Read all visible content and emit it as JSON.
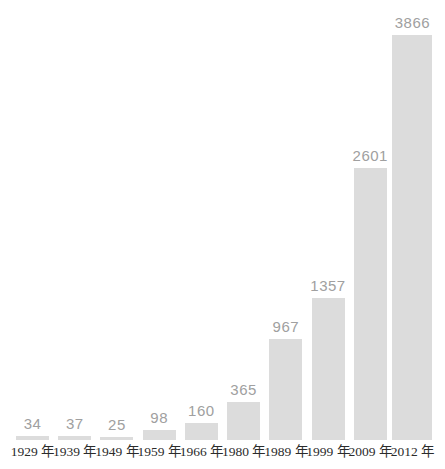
{
  "chart_data": {
    "type": "bar",
    "title": "",
    "xlabel": "",
    "ylabel": "",
    "categories": [
      "1929 年",
      "1939 年",
      "1949 年",
      "1959 年",
      "1966 年",
      "1980 年",
      "1989 年",
      "1999 年",
      "2009 年",
      "2012 年"
    ],
    "values": [
      34,
      37,
      25,
      98,
      160,
      365,
      967,
      1357,
      2601,
      3866
    ],
    "ylim": [
      0,
      3866
    ],
    "grid": false,
    "legend": false,
    "value_labels_shown": true,
    "bar_color": "#dcdcdc",
    "value_label_color": "#a0a0a0",
    "axis_label_color": "#2b2b2b",
    "background_color": "#ffffff"
  }
}
